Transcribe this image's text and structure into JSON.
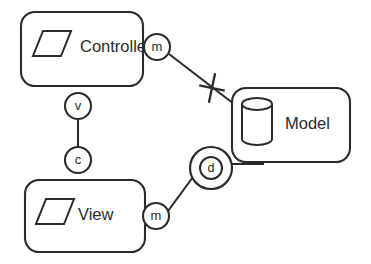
{
  "diagram": {
    "stroke_color": "#2b2b2b",
    "background_color": "#ffffff",
    "components": [
      {
        "id": "controller",
        "label": "Controller",
        "icon": "parallelogram-icon",
        "x": 21,
        "y": 12,
        "w": 122,
        "h": 74,
        "r": 14,
        "label_x": 80,
        "label_y": 47
      },
      {
        "id": "model",
        "label": "Model",
        "icon": "cylinder-icon",
        "x": 232,
        "y": 88,
        "w": 118,
        "h": 74,
        "r": 14,
        "label_x": 285,
        "label_y": 124
      },
      {
        "id": "view",
        "label": "View",
        "icon": "parallelogram-icon",
        "x": 25,
        "y": 180,
        "w": 120,
        "h": 72,
        "r": 14,
        "label_x": 78,
        "label_y": 215
      }
    ],
    "ports": [
      {
        "id": "controller-m",
        "label": "m",
        "cx": 157,
        "cy": 47,
        "r": 13
      },
      {
        "id": "controller-v",
        "label": "v",
        "cx": 78,
        "cy": 106,
        "r": 13
      },
      {
        "id": "view-c",
        "label": "c",
        "cx": 78,
        "cy": 160,
        "r": 13
      },
      {
        "id": "view-m",
        "label": "m",
        "cx": 156,
        "cy": 216,
        "r": 13
      }
    ],
    "sockets": [
      {
        "id": "model-d",
        "label": "d",
        "cx": 211,
        "cy": 168,
        "r_outer": 21,
        "r_inner": 11
      }
    ],
    "connectors": [
      {
        "id": "controller-m-to-model",
        "x1": 169,
        "y1": 54,
        "x2": 234,
        "y2": 104,
        "blocked": true
      },
      {
        "id": "controller-v-to-view-c",
        "x1": 78,
        "y1": 119,
        "x2": 78,
        "y2": 147,
        "blocked": false
      },
      {
        "id": "view-m-to-model-d",
        "x1": 168,
        "y1": 211,
        "x2": 193,
        "y2": 177,
        "blocked": false
      },
      {
        "id": "model-d-to-model",
        "x1": 232,
        "y1": 164,
        "x2": 262,
        "y2": 164,
        "blocked": false
      }
    ],
    "cross_marks": [
      {
        "id": "blocked-link-cross",
        "cx": 212,
        "cy": 88,
        "size": 15,
        "angle": 12
      }
    ],
    "icons": {
      "parallelogram_controller": {
        "x": 33,
        "y": 31,
        "w": 38,
        "h": 25,
        "skew": 10
      },
      "parallelogram_view": {
        "x": 36,
        "y": 199,
        "w": 38,
        "h": 25,
        "skew": 10
      },
      "cylinder": {
        "cx": 257,
        "top_y": 104,
        "rx": 15,
        "ry": 6,
        "height": 35
      }
    }
  }
}
